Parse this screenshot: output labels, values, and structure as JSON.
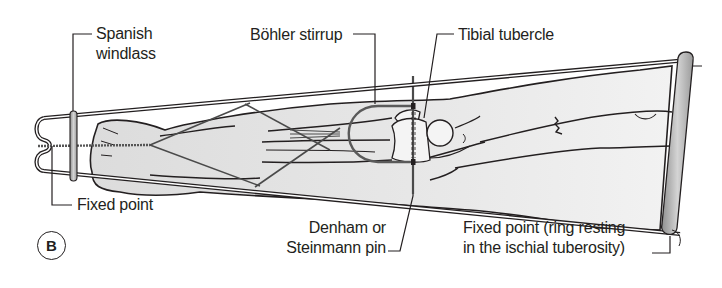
{
  "figure": {
    "panel_label": "B"
  },
  "labels": {
    "spanish_windlass": [
      "Spanish",
      "windlass"
    ],
    "bohler_stirrup": "Böhler stirrup",
    "tibial_tubercle": "Tibial tubercle",
    "fixed_point_left": "Fixed point",
    "denham_pin": [
      "Denham or",
      "Steinmann pin"
    ],
    "fixed_point_right": [
      "Fixed point (ring resting",
      "in the ischial tuberosity)"
    ]
  },
  "colors": {
    "ink": "#231f20",
    "limb_fill": "#e6e6e6",
    "ring_fill": "#b0b0b0",
    "background": "#ffffff"
  }
}
